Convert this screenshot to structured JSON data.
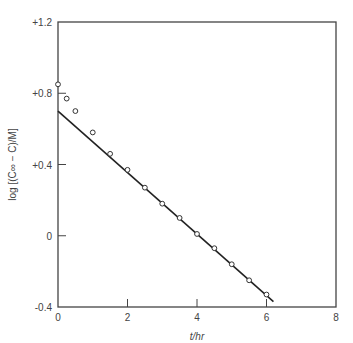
{
  "chart_data": {
    "type": "scatter",
    "title": "",
    "xlabel": "t/hr",
    "ylabel": "log [(C∞ − C)/M]",
    "xlim": [
      0,
      8
    ],
    "ylim": [
      -0.4,
      1.2
    ],
    "x_ticks": [
      0,
      2,
      4,
      6,
      8
    ],
    "x_tick_labels": [
      "0",
      "2",
      "4",
      "6",
      "8"
    ],
    "y_ticks": [
      -0.4,
      0,
      0.4,
      0.8,
      1.2
    ],
    "y_tick_labels": [
      "-0.4",
      "0",
      "+0.4",
      "+0.8",
      "+1.2"
    ],
    "grid": false,
    "series": [
      {
        "name": "measured",
        "marker": "open-circle",
        "x": [
          0,
          0.25,
          0.5,
          1.0,
          1.5,
          2.0,
          2.5,
          3.0,
          3.5,
          4.0,
          4.5,
          5.0,
          5.5,
          6.0
        ],
        "y": [
          0.85,
          0.77,
          0.7,
          0.58,
          0.46,
          0.37,
          0.27,
          0.18,
          0.1,
          0.01,
          -0.07,
          -0.16,
          -0.25,
          -0.33
        ]
      },
      {
        "name": "linear fit",
        "style": "line",
        "x": [
          0,
          6.2
        ],
        "y": [
          0.7,
          -0.37
        ]
      }
    ]
  }
}
